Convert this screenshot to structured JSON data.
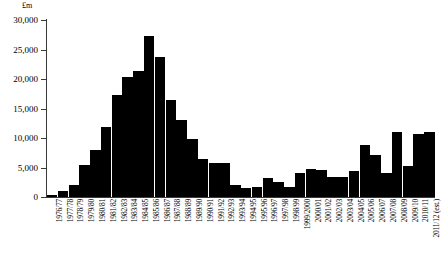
{
  "chart_data": {
    "type": "bar",
    "title": "",
    "subtitle": "",
    "xlabel": "",
    "ylabel": "£m",
    "ylim": [
      0,
      30000
    ],
    "ytick_values": [
      0,
      5000,
      10000,
      15000,
      20000,
      25000,
      30000
    ],
    "ytick_labels": [
      "0",
      "5,000",
      "10,000",
      "15,000",
      "20,000",
      "25,000",
      "30,000"
    ],
    "grid": false,
    "legend": false,
    "bar_color": "#000000",
    "categories": [
      "1976/77",
      "1977/78",
      "1978/79",
      "1979/80",
      "1980/81",
      "1981/82",
      "1982/83",
      "1983/84",
      "1984/85",
      "1985/86",
      "1986/87",
      "1987/88",
      "1988/89",
      "1989/90",
      "1990/91",
      "1991/92",
      "1992/93",
      "1993/94",
      "1994/95",
      "1995/96",
      "1996/97",
      "1997/98",
      "1998/99",
      "1999/2000",
      "2000/01",
      "2001/02",
      "2002/03",
      "2003/04",
      "2004/05",
      "2005/06",
      "2006/07",
      "2007/08",
      "2008/09",
      "2009/10",
      "2010/11",
      "2011/12 (est.)"
    ],
    "values": [
      400,
      1100,
      2100,
      5400,
      8000,
      11900,
      17300,
      20300,
      21400,
      27300,
      23800,
      16400,
      13000,
      9900,
      6400,
      5800,
      5800,
      2000,
      1500,
      1700,
      3200,
      2600,
      1700,
      4000,
      4700,
      4600,
      3400,
      3400,
      4400,
      8800,
      7200,
      4000,
      11000,
      5200,
      10600,
      11000
    ]
  }
}
